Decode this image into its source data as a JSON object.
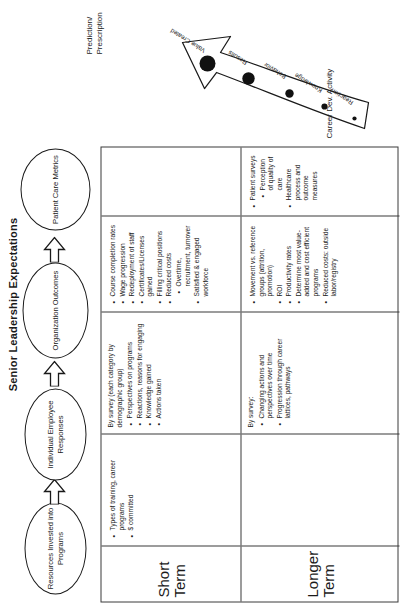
{
  "title": "Senior Leadership Expectations",
  "flow": {
    "nodes": [
      {
        "id": "resources",
        "label": "Resources Invested into Programs"
      },
      {
        "id": "individual",
        "label": "Individual Employee Responses"
      },
      {
        "id": "organization",
        "label": "Organization Outcomes"
      },
      {
        "id": "patient",
        "label": "Patient Care Metrics"
      }
    ],
    "arrows": [
      "block-arrow-right",
      "block-arrow-right",
      "block-arrow-right"
    ]
  },
  "matrix": {
    "rows": [
      {
        "label": "Short Term",
        "cells": [
          {
            "column": "resources",
            "lead": "",
            "items": [
              {
                "text": "Types of training, career programs",
                "sub": []
              },
              {
                "text": "$ committed",
                "sub": []
              }
            ]
          },
          {
            "column": "individual",
            "lead": "By survey (each category by demographic group)",
            "items": [
              {
                "text": "Perspectives on programs",
                "sub": []
              },
              {
                "text": "Reactions, reasons for engaging",
                "sub": []
              },
              {
                "text": "Knowledge gained",
                "sub": []
              },
              {
                "text": "Actions taken",
                "sub": []
              }
            ]
          },
          {
            "column": "organization",
            "lead": "",
            "items": [
              {
                "text": "Course completion rates",
                "sub": []
              },
              {
                "text": "Wage progression",
                "sub": []
              },
              {
                "text": "Redeployment of staff",
                "sub": []
              },
              {
                "text": "Certificates/Licenses gained",
                "sub": []
              },
              {
                "text": "Filling critical positions",
                "sub": []
              },
              {
                "text": "Reduced costs",
                "sub": [
                  "Overtime, recruitment, turnover"
                ]
              },
              {
                "text": "Satisfied & engaged workforce",
                "sub": []
              }
            ]
          },
          {
            "column": "patient",
            "lead": "",
            "items": []
          }
        ]
      },
      {
        "label": "Longer Term",
        "cells": [
          {
            "column": "resources",
            "lead": "",
            "items": []
          },
          {
            "column": "individual",
            "lead": "By survey:",
            "items": [
              {
                "text": "Changing actions and perspectives over time",
                "sub": []
              },
              {
                "text": "Progression through career lattices, pathways",
                "sub": []
              }
            ]
          },
          {
            "column": "organization",
            "lead": "",
            "items": [
              {
                "text": "Movement vs. reference groups (attrition, promotion)",
                "sub": []
              },
              {
                "text": "ROI",
                "sub": []
              },
              {
                "text": "Productivity rates",
                "sub": []
              },
              {
                "text": "Determine most value-added and cost efficient programs",
                "sub": []
              },
              {
                "text": "Reduced costs: outside labor/registry",
                "sub": []
              }
            ]
          },
          {
            "column": "patient",
            "lead": "",
            "items": [
              {
                "text": "Patient surveys",
                "sub": [
                  "Perception of quality of care"
                ]
              },
              {
                "text": "Healthcare process and outcome measures",
                "sub": []
              }
            ]
          }
        ]
      }
    ]
  },
  "curve": {
    "prediction_label": "Prediction/ Prescription",
    "axis_label": "Career Dev. Activity",
    "stages": [
      {
        "label": "Reaction",
        "dot": 2.0
      },
      {
        "label": "Knowledge",
        "dot": 3.0
      },
      {
        "label": "Behavior",
        "dot": 4.5
      },
      {
        "label": "Results",
        "dot": 7.0
      },
      {
        "label": "Value Created",
        "dot": 9.5
      }
    ]
  }
}
